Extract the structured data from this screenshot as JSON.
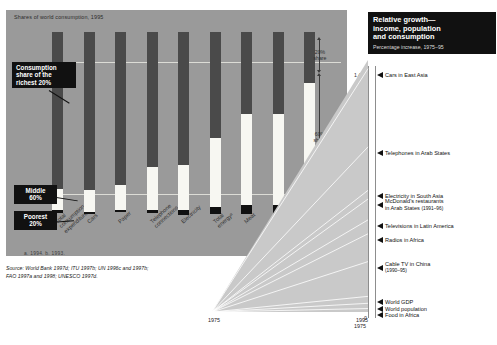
{
  "left": {
    "title": "Shares of world consumption, 1995",
    "footnote": "a. 1994.   b. 1993.",
    "source_line1": "Source: World Bank 1997d; ITU 1997b; UN 1996c and 1997b;",
    "source_line2": "FAO 1997a and 1998; UNESCO 1997d.",
    "callouts": {
      "richest": "Consumption\nshare of the\nrichest 20%",
      "richest_l1": "Consumption",
      "richest_l2": "share of the",
      "richest_l3": "richest 20%",
      "middle_l1": "Middle",
      "middle_l2": "60%",
      "poorest_l1": "Poorest",
      "poorest_l2": "20%"
    },
    "share_axis": [
      {
        "label_l1": "20%",
        "label_l2": "share"
      },
      {
        "label_l1": "60%",
        "label_l2": "share"
      },
      {
        "label_l1": "20%",
        "label_l2": "share"
      }
    ]
  },
  "right": {
    "title_l1": "Relative growth—",
    "title_l2": "income, population",
    "title_l3": "and consumption",
    "subtitle": "Percentage increase, 1975–95",
    "year_start": "1975",
    "year_end": "1995"
  },
  "chart_data": [
    {
      "type": "bar",
      "title": "Shares of world consumption, 1995",
      "xlabel": "",
      "ylabel": "Share of world consumption (%)",
      "ylim": [
        0,
        100
      ],
      "stacked": true,
      "categories": [
        "Total consumption expenditure",
        "Cars",
        "Paper",
        "Telephone connections",
        "Electricity",
        "Total energyᵃ",
        "Meat",
        "Fishᵇ",
        "Cereals"
      ],
      "series": [
        {
          "name": "Richest 20%",
          "color": "#4a4a4a",
          "values": [
            86,
            87,
            84,
            74,
            73,
            58,
            45,
            45,
            28
          ]
        },
        {
          "name": "Middle 60%",
          "color": "#f7f7f2",
          "values": [
            12,
            12,
            14,
            24,
            25,
            38,
            50,
            50,
            58
          ]
        },
        {
          "name": "Poorest 20%",
          "color": "#111111",
          "values": [
            1.3,
            1,
            1.1,
            1.5,
            2.5,
            4,
            5,
            5,
            14
          ]
        }
      ],
      "gridlines": [
        "20% share",
        "60% share",
        "20% share"
      ]
    },
    {
      "type": "line",
      "title": "Relative growth—income, population and consumption",
      "subtitle": "Percentage increase, 1975–95",
      "xlabel": "",
      "ylabel": "Percentage increase",
      "x": [
        "1975",
        "1995"
      ],
      "ylim": [
        0,
        1450
      ],
      "yticks": [
        0,
        200,
        400,
        600,
        800,
        1000,
        1200,
        1400
      ],
      "ytick_labels": [
        "0",
        "200",
        "400",
        "600",
        "800",
        "1,000",
        "1,200",
        "1,400"
      ],
      "endpoints": [
        {
          "label": "Cars in East Asia",
          "note": "",
          "value": 1400
        },
        {
          "label": "Telephones in Arab States",
          "note": "",
          "value": 950
        },
        {
          "label": "Electricity in South Asia",
          "note": "",
          "value": 700
        },
        {
          "label": "McDonald's restaurants",
          "label2": "in Arab States",
          "note": "(1991–96)",
          "value": 650
        },
        {
          "label": "Televisions in Latin America",
          "note": "",
          "value": 530
        },
        {
          "label": "Radios in Africa",
          "note": "",
          "value": 450
        },
        {
          "label": "Cable TV in China",
          "note": "(1990–95)",
          "value": 290
        },
        {
          "label": "World GDP",
          "note": "",
          "value": 90
        },
        {
          "label": "World population",
          "note": "",
          "value": 50
        },
        {
          "label": "Food in Africa",
          "note": "",
          "value": 20
        }
      ]
    }
  ]
}
